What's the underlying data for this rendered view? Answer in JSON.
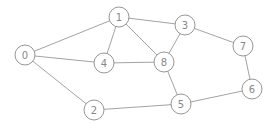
{
  "graph": {
    "nodes": [
      {
        "id": "0",
        "label": "0",
        "x": 25,
        "y": 55
      },
      {
        "id": "1",
        "label": "1",
        "x": 119,
        "y": 17
      },
      {
        "id": "2",
        "label": "2",
        "x": 94,
        "y": 110
      },
      {
        "id": "3",
        "label": "3",
        "x": 185,
        "y": 25
      },
      {
        "id": "4",
        "label": "4",
        "x": 104,
        "y": 63
      },
      {
        "id": "5",
        "label": "5",
        "x": 181,
        "y": 104
      },
      {
        "id": "6",
        "label": "6",
        "x": 252,
        "y": 89
      },
      {
        "id": "7",
        "label": "7",
        "x": 243,
        "y": 46
      },
      {
        "id": "8",
        "label": "8",
        "x": 164,
        "y": 62
      }
    ],
    "edges": [
      [
        "0",
        "1"
      ],
      [
        "0",
        "4"
      ],
      [
        "0",
        "2"
      ],
      [
        "1",
        "3"
      ],
      [
        "1",
        "4"
      ],
      [
        "1",
        "8"
      ],
      [
        "3",
        "8"
      ],
      [
        "3",
        "7"
      ],
      [
        "4",
        "8"
      ],
      [
        "8",
        "5"
      ],
      [
        "2",
        "5"
      ],
      [
        "5",
        "6"
      ],
      [
        "7",
        "6"
      ]
    ],
    "node_radius": 10,
    "colors": {
      "stroke": "#8a8a8a",
      "text": "#888888",
      "background": "#ffffff"
    }
  }
}
